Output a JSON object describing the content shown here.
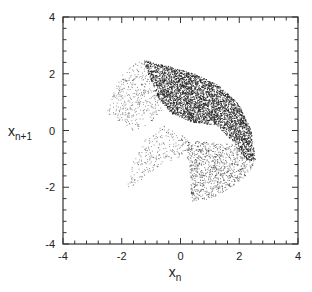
{
  "chart_data": {
    "type": "scatter",
    "title": "",
    "xlabel": "x",
    "xlabel_sub": "n",
    "ylabel": "x",
    "ylabel_sub": "n+1",
    "xlim": [
      -4,
      4
    ],
    "ylim": [
      -4,
      4
    ],
    "xticks": [
      -4,
      -2,
      0,
      2,
      4
    ],
    "yticks": [
      -4,
      -2,
      0,
      2,
      4
    ],
    "minor_tick_step": 0.4,
    "grid": false,
    "legend": null,
    "marker_color": "#1a1a1a",
    "regions": [
      {
        "name": "dense-arc-band",
        "density": "high",
        "polygon": [
          [
            -1.3,
            2.5
          ],
          [
            -0.5,
            2.3
          ],
          [
            0.5,
            2.0
          ],
          [
            1.3,
            1.6
          ],
          [
            2.0,
            0.9
          ],
          [
            2.4,
            0.0
          ],
          [
            2.55,
            -1.1
          ],
          [
            2.2,
            -1.0
          ],
          [
            1.8,
            -0.4
          ],
          [
            1.2,
            0.2
          ],
          [
            0.4,
            0.3
          ],
          [
            -0.3,
            0.6
          ],
          [
            -0.8,
            1.2
          ],
          [
            -1.1,
            2.0
          ]
        ]
      },
      {
        "name": "left-lobe",
        "density": "low",
        "polygon": [
          [
            -1.3,
            2.5
          ],
          [
            -1.9,
            2.2
          ],
          [
            -2.4,
            1.2
          ],
          [
            -2.55,
            0.5
          ],
          [
            -2.2,
            0.4
          ],
          [
            -1.6,
            0.0
          ],
          [
            -1.0,
            0.3
          ],
          [
            -0.6,
            0.8
          ],
          [
            -0.9,
            1.6
          ]
        ]
      },
      {
        "name": "lower-left-lobe",
        "density": "low",
        "polygon": [
          [
            -0.6,
            0.2
          ],
          [
            -1.2,
            -0.3
          ],
          [
            -1.6,
            -1.0
          ],
          [
            -1.85,
            -2.05
          ],
          [
            -1.4,
            -1.8
          ],
          [
            -0.7,
            -1.2
          ],
          [
            0.0,
            -0.9
          ],
          [
            0.3,
            -0.3
          ]
        ]
      },
      {
        "name": "lower-right-lobe",
        "density": "medium",
        "polygon": [
          [
            0.0,
            -0.3
          ],
          [
            0.3,
            -1.2
          ],
          [
            0.35,
            -2.5
          ],
          [
            1.0,
            -2.4
          ],
          [
            1.7,
            -2.0
          ],
          [
            2.2,
            -1.6
          ],
          [
            2.5,
            -1.2
          ],
          [
            2.0,
            -0.5
          ],
          [
            1.0,
            -0.4
          ]
        ]
      }
    ],
    "points_generated": 5200,
    "seed": 12345
  }
}
